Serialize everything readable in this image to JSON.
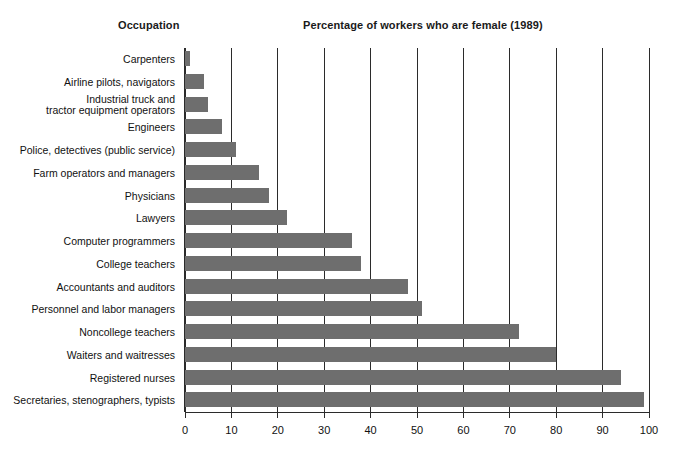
{
  "header": {
    "occupation_label": "Occupation",
    "title": "Percentage of workers who are female (1989)"
  },
  "axis": {
    "ticks": [
      "0",
      "10",
      "20",
      "30",
      "40",
      "50",
      "60",
      "70",
      "80",
      "90",
      "100"
    ]
  },
  "colors": {
    "bar": "#6e6e6e",
    "axis": "#2b2b2b",
    "text": "#111111",
    "background": "#ffffff"
  },
  "rows": [
    {
      "label": "Carpenters",
      "value": 1
    },
    {
      "label": "Airline pilots, navigators",
      "value": 4
    },
    {
      "label_line1": "Industrial truck and",
      "label_line2": "tractor equipment operators",
      "label": "Industrial truck and tractor equipment operators",
      "value": 5
    },
    {
      "label": "Engineers",
      "value": 8
    },
    {
      "label": "Police, detectives (public service)",
      "value": 11
    },
    {
      "label": "Farm operators and managers",
      "value": 16
    },
    {
      "label": "Physicians",
      "value": 18
    },
    {
      "label": "Lawyers",
      "value": 22
    },
    {
      "label": "Computer programmers",
      "value": 36
    },
    {
      "label": "College teachers",
      "value": 38
    },
    {
      "label": "Accountants and auditors",
      "value": 48
    },
    {
      "label": "Personnel and labor managers",
      "value": 51
    },
    {
      "label": "Noncollege teachers",
      "value": 72
    },
    {
      "label": "Waiters and waitresses",
      "value": 80
    },
    {
      "label": "Registered nurses",
      "value": 94
    },
    {
      "label": "Secretaries, stenographers, typists",
      "value": 99
    }
  ],
  "chart_data": {
    "type": "bar",
    "orientation": "horizontal",
    "title": "Percentage of workers who are female (1989)",
    "xlabel": "",
    "ylabel": "Occupation",
    "xlim": [
      0,
      100
    ],
    "xticks": [
      0,
      10,
      20,
      30,
      40,
      50,
      60,
      70,
      80,
      90,
      100
    ],
    "grid": "vertical",
    "legend": "none",
    "categories": [
      "Carpenters",
      "Airline pilots, navigators",
      "Industrial truck and tractor equipment operators",
      "Engineers",
      "Police, detectives (public service)",
      "Farm operators and managers",
      "Physicians",
      "Lawyers",
      "Computer programmers",
      "College teachers",
      "Accountants and auditors",
      "Personnel and labor managers",
      "Noncollege teachers",
      "Waiters and waitresses",
      "Registered nurses",
      "Secretaries, stenographers, typists"
    ],
    "values": [
      1,
      4,
      5,
      8,
      11,
      16,
      18,
      22,
      36,
      38,
      48,
      51,
      72,
      80,
      94,
      99
    ],
    "series": [
      {
        "name": "Percentage female",
        "values": [
          1,
          4,
          5,
          8,
          11,
          16,
          18,
          22,
          36,
          38,
          48,
          51,
          72,
          80,
          94,
          99
        ]
      }
    ]
  }
}
